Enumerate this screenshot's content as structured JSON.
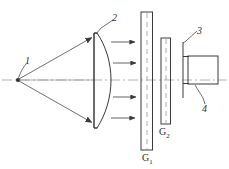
{
  "figure": {
    "type": "optical-schematic",
    "background": "#ffffff",
    "stroke_color": "#3a3a3a",
    "axis_color": "#9a9a9a",
    "label_color": "#2b2b2b",
    "width": 229,
    "height": 169
  },
  "labels": {
    "source": "1",
    "lens": "2",
    "bracket": "3",
    "detector": "4",
    "plate1": "G",
    "plate1_sub": "1",
    "plate2": "G",
    "plate2_sub": "2"
  },
  "components": [
    {
      "name": "point-light-source",
      "label": "1",
      "x": 18,
      "y": 80
    },
    {
      "name": "plano-convex-lens",
      "label": "2",
      "x_flat": 93,
      "x_apex": 111,
      "y_top": 33,
      "y_bottom": 128
    },
    {
      "name": "glass-plate-g1",
      "label": "G1",
      "x": 141,
      "width": 11,
      "y_top": 12,
      "y_bottom": 150
    },
    {
      "name": "glass-plate-g2",
      "label": "G2",
      "x": 161,
      "width": 9,
      "y_top": 38,
      "y_bottom": 124
    },
    {
      "name": "mount-bracket",
      "label": "3",
      "x": 183,
      "y_top": 42,
      "y_bottom": 98
    },
    {
      "name": "detector-box",
      "label": "4",
      "x": 188,
      "y": 56,
      "width": 30,
      "height": 28
    }
  ],
  "rays": {
    "count": 3,
    "description": "diverging rays from source to lens, then collimated arrows",
    "collimated_arrow_y": [
      42,
      63,
      96,
      117
    ]
  },
  "optical_axis": {
    "y": 80,
    "x_start": 2,
    "x_end": 227,
    "style": "dash-dot"
  }
}
